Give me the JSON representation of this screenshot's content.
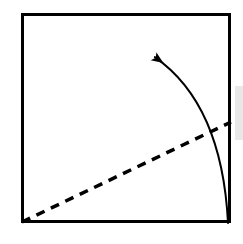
{
  "document": {
    "type": "geometric-diagram",
    "title": "Square with dashed diagonal and curved arrow",
    "width": 243,
    "height": 244,
    "background_color": "#ffffff"
  },
  "colors": {
    "stroke": "#000000",
    "background": "#ffffff",
    "gray_band": "#e8e8e8"
  },
  "chart_data": {
    "type": "diagram",
    "xlabel": "",
    "ylabel": "",
    "xlim": [
      0,
      243
    ],
    "ylim": [
      0,
      244
    ],
    "grid": false,
    "legend": "none",
    "elements": [
      {
        "name": "square-frame",
        "kind": "rectangle",
        "x": 21,
        "y": 13,
        "width": 210,
        "height": 210,
        "stroke": "#000000",
        "stroke_width": 3,
        "fill": "none",
        "corners": [
          [
            21,
            13
          ],
          [
            231,
            13
          ],
          [
            231,
            223
          ],
          [
            21,
            223
          ]
        ]
      },
      {
        "name": "dashed-diagonal",
        "kind": "line",
        "start": [
          22,
          222
        ],
        "end": [
          231,
          122
        ],
        "stroke": "#000000",
        "stroke_width": 3.5,
        "dash_pattern": [
          9,
          7
        ],
        "style": "dashed"
      },
      {
        "name": "curved-arrow",
        "kind": "curve",
        "start": [
          228,
          223
        ],
        "control": [
          222,
          104
        ],
        "end": [
          152,
          56
        ],
        "stroke": "#000000",
        "stroke_width": 2,
        "style": "solid",
        "arrowhead": {
          "at": [
            149,
            53
          ],
          "direction_deg": 215,
          "length": 17,
          "width": 9,
          "filled": true
        }
      },
      {
        "name": "gray-band",
        "kind": "rectangle",
        "x": 235,
        "y": 86,
        "width": 8,
        "height": 54,
        "fill": "#e8e8e8",
        "stroke": "none"
      }
    ]
  }
}
